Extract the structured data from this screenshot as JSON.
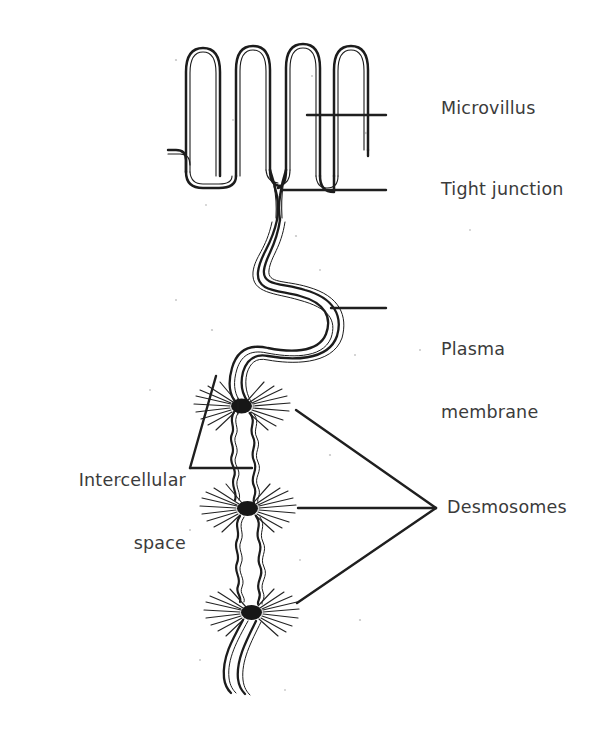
{
  "figure": {
    "background_color": "#ffffff",
    "ink_color": "#1c1c1c",
    "label_color": "#3b3b3b"
  },
  "labels": {
    "microvillus": "Microvillus",
    "tight_junction": "Tight junction",
    "plasma_membrane_line1": "Plasma",
    "plasma_membrane_line2": "membrane",
    "intercellular_space_line1": "Intercellular",
    "intercellular_space_line2": "space",
    "desmosomes": "Desmosomes"
  },
  "structures": {
    "microvilli_count": 4,
    "desmosome_count": 3,
    "tight_junction_count": 1,
    "intercellular_space_count": 2
  },
  "leader_lines": [
    {
      "name": "microvillus-leader",
      "from": [
        386,
        115
      ],
      "to": [
        307,
        115
      ]
    },
    {
      "name": "tight-junction-leader",
      "from": [
        386,
        190
      ],
      "to": [
        281,
        190
      ]
    },
    {
      "name": "plasma-membrane-leader",
      "from": [
        386,
        308
      ],
      "to": [
        331,
        308
      ]
    },
    {
      "name": "intercellular-space-leader-1",
      "from": [
        190,
        468
      ],
      "to": [
        252,
        468
      ]
    },
    {
      "name": "intercellular-space-leader-2",
      "from": [
        190,
        468
      ],
      "to": [
        216,
        376
      ]
    },
    {
      "name": "desmosome-leader-1",
      "from": [
        436,
        508
      ],
      "to": [
        296,
        410
      ]
    },
    {
      "name": "desmosome-leader-2",
      "from": [
        436,
        508
      ],
      "to": [
        298,
        508
      ]
    },
    {
      "name": "desmosome-leader-3",
      "from": [
        436,
        508
      ],
      "to": [
        297,
        603
      ]
    }
  ]
}
